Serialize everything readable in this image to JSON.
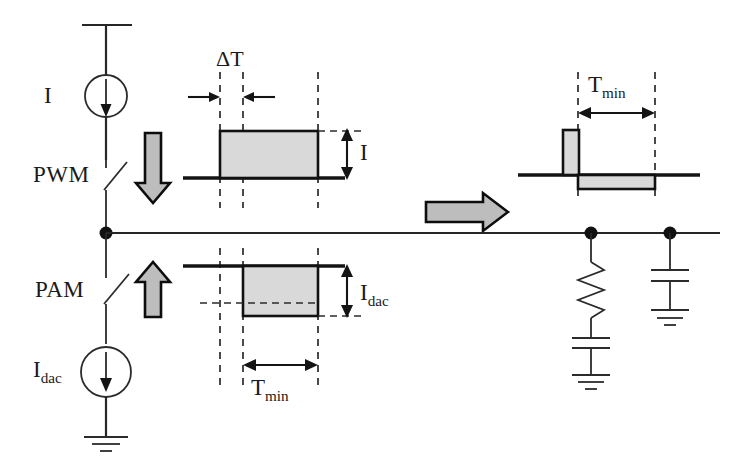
{
  "diagram": {
    "title_text": "",
    "labels": {
      "current_source_top": "I",
      "pwm": "PWM",
      "pam": "PAM",
      "current_source_bottom_base": "I",
      "current_source_bottom_sub": "dac",
      "delta_t": "ΔT",
      "amplitude_i": "I",
      "amplitude_idac_base": "I",
      "amplitude_idac_sub": "dac",
      "tmin_mid_base": "T",
      "tmin_mid_sub": "min",
      "tmin_right_base": "T",
      "tmin_right_sub": "min"
    },
    "icons": {
      "supply_rail": "supply-rail-icon",
      "current_source_symbol": "current-source-icon",
      "switch_symbol": "switch-icon",
      "ground_symbol": "ground-icon",
      "resistor_symbol": "resistor-icon",
      "capacitor_symbol": "capacitor-icon",
      "node_dot": "node-dot-icon",
      "down_arrow": "down-arrow-icon",
      "up_arrow": "up-arrow-icon",
      "transform_arrow": "right-arrow-icon"
    },
    "colors": {
      "line": "#262626",
      "fill_gray": "#d9d9d9",
      "arrow_gray": "#bdbdbd",
      "background": "#ffffff"
    },
    "waveforms": {
      "pwm_pulse": {
        "name": "pwm-current-pulse",
        "baseline_y": 178,
        "amplitude_label": "I",
        "polarity": "positive"
      },
      "pam_pulse": {
        "name": "pam-current-pulse",
        "baseline_y": 266,
        "amplitude_label": "Idac",
        "polarity": "negative",
        "width_label": "Tmin"
      },
      "combined_pulse": {
        "name": "combined-current-pulse",
        "baseline_y": 175,
        "narrow_pulse_polarity": "positive",
        "wide_pulse_polarity": "negative",
        "width_label": "Tmin"
      }
    },
    "load_network": {
      "branch_1": [
        "resistor",
        "capacitor",
        "ground"
      ],
      "branch_2": [
        "capacitor",
        "ground"
      ]
    }
  }
}
